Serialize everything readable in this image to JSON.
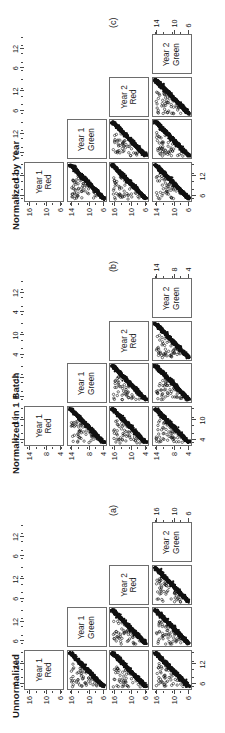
{
  "figure": {
    "orientation": "rotated-90-ccw",
    "variables": [
      "Year 1 Red",
      "Year 1 Green",
      "Year 2 Red",
      "Year 2 Green"
    ],
    "diagonal_labels": [
      {
        "line1": "Year 1",
        "line2": "Red"
      },
      {
        "line1": "Year 1",
        "line2": "Green"
      },
      {
        "line1": "Year 2",
        "line2": "Red"
      },
      {
        "line1": "Year 2",
        "line2": "Green"
      }
    ]
  },
  "panels": [
    {
      "id": "c",
      "letter": "(c)",
      "title": "Normalized by Year",
      "row_ticks": [
        [
          "6",
          "10",
          "16"
        ],
        [
          "6",
          "10",
          "14"
        ],
        [
          "6",
          "10",
          "16"
        ],
        [
          "6",
          "10",
          "14"
        ]
      ],
      "col_ticks": [
        [
          "6",
          "12"
        ],
        [
          "6",
          "12"
        ],
        [
          "6",
          "12"
        ],
        [
          "6",
          "12"
        ]
      ],
      "axis_ranges": {
        "Year 1 Red": [
          4,
          17
        ],
        "Year 1 Green": [
          4,
          17
        ],
        "Year 2 Red": [
          4,
          16
        ],
        "Year 2 Green": [
          4,
          17
        ]
      }
    },
    {
      "id": "b",
      "letter": "(b)",
      "title": "Normalized in 1 Batch",
      "row_ticks": [
        [
          "4",
          "8",
          "14"
        ],
        [
          "4",
          "8",
          "14"
        ],
        [
          "4",
          "10",
          "16"
        ],
        [
          "4",
          "8",
          "14"
        ]
      ],
      "col_ticks": [
        [
          "4",
          "10"
        ],
        [
          "4",
          "12"
        ],
        [
          "4",
          "10"
        ],
        [
          "4",
          "12"
        ]
      ],
      "axis_ranges": {
        "Year 1 Red": [
          2,
          16
        ],
        "Year 1 Green": [
          2,
          17
        ],
        "Year 2 Red": [
          2,
          16
        ],
        "Year 2 Green": [
          2,
          17
        ]
      }
    },
    {
      "id": "a",
      "letter": "(a)",
      "title": "Unnormalized",
      "row_ticks": [
        [
          "6",
          "10",
          "16"
        ],
        [
          "6",
          "10",
          "16"
        ],
        [
          "6",
          "10",
          "16"
        ],
        [
          "6",
          "10",
          "16"
        ]
      ],
      "col_ticks": [
        [
          "6",
          "12"
        ],
        [
          "6",
          "12"
        ],
        [
          "6",
          "12"
        ],
        [
          "6",
          "12"
        ]
      ],
      "axis_ranges": {
        "Year 1 Red": [
          4,
          17
        ],
        "Year 1 Green": [
          4,
          17
        ],
        "Year 2 Red": [
          4,
          17
        ],
        "Year 2 Green": [
          4,
          17
        ]
      }
    }
  ],
  "chart_data": {
    "type": "scatter",
    "subtitle": "Three normalization conditions: (a) Unnormalized, (b) Normalized in 1 Batch, (c) Normalized by Year",
    "layout": "3 stacked 4x4 lower-triangular scatterplot matrices (pairs plots)",
    "legend": "none",
    "grid": false,
    "xlabel": "",
    "ylabel": "",
    "categories": [
      "Year 1 Red",
      "Year 1 Green",
      "Year 2 Red",
      "Year 2 Green"
    ],
    "relationship": "Each off-diagonal cell shows a dense negatively-sloped band of points (strong inverse linear relationship) with a scattered cloud of outlier points above/left of the main band.",
    "n_points_per_cell_approx": 900,
    "point_symbol": "open circle",
    "point_color": "#111111",
    "panel_border_color": "#6d6d6d",
    "background": "#ffffff",
    "cells": [
      {
        "panel": "a",
        "row": "Year 1 Green",
        "col": "Year 1 Red",
        "xlim": [
          4,
          17
        ],
        "ylim": [
          4,
          17
        ],
        "slope": -1,
        "correlation": -0.95
      },
      {
        "panel": "a",
        "row": "Year 2 Red",
        "col": "Year 1 Red",
        "xlim": [
          4,
          17
        ],
        "ylim": [
          4,
          17
        ],
        "slope": -1,
        "correlation": -0.93
      },
      {
        "panel": "a",
        "row": "Year 2 Red",
        "col": "Year 1 Green",
        "xlim": [
          4,
          17
        ],
        "ylim": [
          4,
          17
        ],
        "slope": -1,
        "correlation": -0.9
      },
      {
        "panel": "a",
        "row": "Year 2 Green",
        "col": "Year 1 Red",
        "xlim": [
          4,
          17
        ],
        "ylim": [
          4,
          17
        ],
        "slope": -1,
        "correlation": -0.94
      },
      {
        "panel": "a",
        "row": "Year 2 Green",
        "col": "Year 1 Green",
        "xlim": [
          4,
          17
        ],
        "ylim": [
          4,
          17
        ],
        "slope": -1,
        "correlation": -0.91
      },
      {
        "panel": "a",
        "row": "Year 2 Green",
        "col": "Year 2 Red",
        "xlim": [
          4,
          17
        ],
        "ylim": [
          4,
          17
        ],
        "slope": -1,
        "correlation": -0.98
      },
      {
        "panel": "b",
        "row": "Year 1 Green",
        "col": "Year 1 Red",
        "xlim": [
          2,
          16
        ],
        "ylim": [
          2,
          17
        ],
        "slope": -1,
        "correlation": -0.95
      },
      {
        "panel": "b",
        "row": "Year 2 Red",
        "col": "Year 1 Red",
        "xlim": [
          2,
          16
        ],
        "ylim": [
          2,
          16
        ],
        "slope": -1,
        "correlation": -0.93
      },
      {
        "panel": "b",
        "row": "Year 2 Red",
        "col": "Year 1 Green",
        "xlim": [
          2,
          17
        ],
        "ylim": [
          2,
          16
        ],
        "slope": -1,
        "correlation": -0.9
      },
      {
        "panel": "b",
        "row": "Year 2 Green",
        "col": "Year 1 Red",
        "xlim": [
          2,
          16
        ],
        "ylim": [
          2,
          17
        ],
        "slope": -1,
        "correlation": -0.94
      },
      {
        "panel": "b",
        "row": "Year 2 Green",
        "col": "Year 1 Green",
        "xlim": [
          2,
          17
        ],
        "ylim": [
          2,
          17
        ],
        "slope": -1,
        "correlation": -0.91
      },
      {
        "panel": "b",
        "row": "Year 2 Green",
        "col": "Year 2 Red",
        "xlim": [
          2,
          16
        ],
        "ylim": [
          2,
          17
        ],
        "slope": -1,
        "correlation": -0.98
      },
      {
        "panel": "c",
        "row": "Year 1 Green",
        "col": "Year 1 Red",
        "xlim": [
          4,
          17
        ],
        "ylim": [
          4,
          16
        ],
        "slope": -1,
        "correlation": -0.95
      },
      {
        "panel": "c",
        "row": "Year 2 Red",
        "col": "Year 1 Red",
        "xlim": [
          4,
          17
        ],
        "ylim": [
          4,
          17
        ],
        "slope": -1,
        "correlation": -0.93
      },
      {
        "panel": "c",
        "row": "Year 2 Red",
        "col": "Year 1 Green",
        "xlim": [
          4,
          16
        ],
        "ylim": [
          4,
          17
        ],
        "slope": -1,
        "correlation": -0.9
      },
      {
        "panel": "c",
        "row": "Year 2 Green",
        "col": "Year 1 Red",
        "xlim": [
          4,
          17
        ],
        "ylim": [
          4,
          17
        ],
        "slope": -1,
        "correlation": -0.94
      },
      {
        "panel": "c",
        "row": "Year 2 Green",
        "col": "Year 1 Green",
        "xlim": [
          4,
          16
        ],
        "ylim": [
          4,
          17
        ],
        "slope": -1,
        "correlation": -0.91
      },
      {
        "panel": "c",
        "row": "Year 2 Green",
        "col": "Year 2 Red",
        "xlim": [
          4,
          17
        ],
        "ylim": [
          4,
          17
        ],
        "slope": -1,
        "correlation": -0.98
      }
    ]
  }
}
